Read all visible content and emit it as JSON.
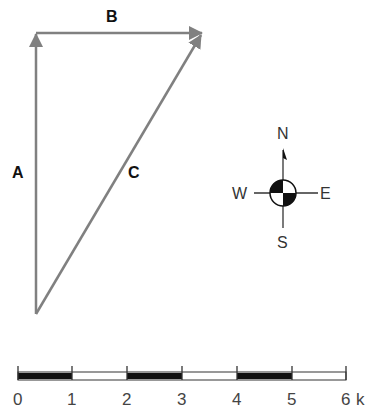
{
  "diagram": {
    "type": "vector_diagram",
    "vectors": [
      {
        "label": "A",
        "from": [
          36,
          314
        ],
        "to": [
          36,
          32
        ],
        "color": "#808080"
      },
      {
        "label": "B",
        "from": [
          36,
          33
        ],
        "to": [
          203,
          33
        ],
        "color": "#808080"
      },
      {
        "label": "C",
        "from": [
          36,
          314
        ],
        "to": [
          203,
          33
        ],
        "color": "#808080"
      }
    ],
    "labels": {
      "A": "A",
      "B": "B",
      "C": "C"
    },
    "compass": {
      "north": "N",
      "south": "S",
      "east": "E",
      "west": "W"
    },
    "scale_bar": {
      "ticks": [
        "0",
        "1",
        "2",
        "3",
        "4",
        "5",
        "6"
      ],
      "unit_suffix": "k",
      "unit_label": "6 k"
    }
  }
}
